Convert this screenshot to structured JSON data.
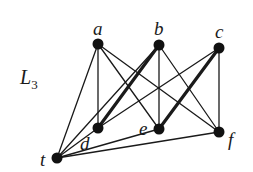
{
  "diagram": {
    "title": "L",
    "title_subscript": "3",
    "title_position": {
      "x": 20,
      "y": 84
    },
    "colors": {
      "background": "#ffffff",
      "edge": "#1a1a1a",
      "node": "#111111",
      "label": "#1a1a1a"
    },
    "nodes": [
      {
        "id": "a",
        "label": "a",
        "x": 98,
        "y": 44,
        "label_dx": -5,
        "label_dy": -9
      },
      {
        "id": "b",
        "label": "b",
        "x": 159,
        "y": 45,
        "label_dx": -5,
        "label_dy": -10
      },
      {
        "id": "c",
        "label": "c",
        "x": 219,
        "y": 48,
        "label_dx": -4,
        "label_dy": -10
      },
      {
        "id": "d",
        "label": "d",
        "x": 98,
        "y": 128,
        "label_dx": -18,
        "label_dy": 22
      },
      {
        "id": "e",
        "label": "e",
        "x": 159,
        "y": 129,
        "label_dx": -20,
        "label_dy": 6
      },
      {
        "id": "f",
        "label": "f",
        "x": 219,
        "y": 132,
        "label_dx": 9,
        "label_dy": 14
      },
      {
        "id": "t",
        "label": "t",
        "x": 57,
        "y": 158,
        "label_dx": -17,
        "label_dy": 8
      }
    ],
    "edges": [
      {
        "from": "t",
        "to": "a",
        "weight": "thin"
      },
      {
        "from": "t",
        "to": "b",
        "weight": "thin"
      },
      {
        "from": "t",
        "to": "e",
        "weight": "thin"
      },
      {
        "from": "t",
        "to": "f",
        "weight": "thin"
      },
      {
        "from": "t",
        "to": "d",
        "weight": "thin"
      },
      {
        "from": "a",
        "to": "d",
        "weight": "thin"
      },
      {
        "from": "a",
        "to": "e",
        "weight": "thin"
      },
      {
        "from": "a",
        "to": "f",
        "weight": "thin"
      },
      {
        "from": "b",
        "to": "d",
        "weight": "thick"
      },
      {
        "from": "b",
        "to": "e",
        "weight": "thin"
      },
      {
        "from": "b",
        "to": "f",
        "weight": "thin"
      },
      {
        "from": "c",
        "to": "d",
        "weight": "thin"
      },
      {
        "from": "c",
        "to": "e",
        "weight": "thick"
      },
      {
        "from": "c",
        "to": "f",
        "weight": "thin"
      }
    ],
    "node_radius": 5.5,
    "edge_widths": {
      "thin": 1.3,
      "thick": 3.2
    }
  }
}
